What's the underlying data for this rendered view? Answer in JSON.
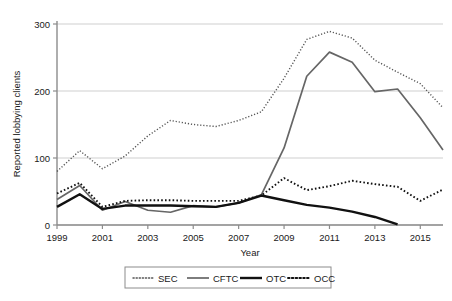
{
  "chart_data": {
    "type": "line",
    "title": "",
    "xlabel": "Year",
    "ylabel": "Reported lobbying clients",
    "xlim": [
      1999,
      2016
    ],
    "ylim": [
      0,
      300
    ],
    "grid": true,
    "legend_position": "bottom",
    "x_tick_labels": [
      "1999",
      "2001",
      "2003",
      "2005",
      "2007",
      "2009",
      "2011",
      "2013",
      "2015"
    ],
    "x_ticks": [
      1999,
      2001,
      2003,
      2005,
      2007,
      2009,
      2011,
      2013,
      2015
    ],
    "y_tick_labels": [
      "0",
      "100",
      "200",
      "300"
    ],
    "y_ticks": [
      0,
      100,
      200,
      300
    ],
    "x": [
      1999,
      2000,
      2001,
      2002,
      2003,
      2004,
      2005,
      2006,
      2007,
      2008,
      2009,
      2010,
      2011,
      2012,
      2013,
      2014,
      2015,
      2016
    ],
    "series": [
      {
        "name": "SEC",
        "style": "dotted",
        "color": "#555555",
        "width": 1.4,
        "values": [
          80,
          111,
          84,
          103,
          133,
          156,
          150,
          147,
          156,
          169,
          219,
          277,
          289,
          279,
          246,
          228,
          211,
          175
        ]
      },
      {
        "name": "CFTC",
        "style": "solid",
        "color": "#666666",
        "width": 1.7,
        "values": [
          38,
          59,
          22,
          35,
          22,
          19,
          29,
          27,
          33,
          45,
          115,
          222,
          258,
          243,
          199,
          203,
          160,
          112
        ]
      },
      {
        "name": "OTC",
        "style": "solid",
        "color": "#111111",
        "width": 2.4,
        "values": [
          27,
          46,
          24,
          29,
          29,
          29,
          28,
          27,
          33,
          44,
          37,
          30,
          26,
          20,
          12,
          1,
          null,
          null
        ]
      },
      {
        "name": "OCC",
        "style": "dotted",
        "color": "#111111",
        "width": 1.9,
        "values": [
          47,
          63,
          27,
          36,
          37,
          37,
          36,
          36,
          36,
          44,
          70,
          52,
          58,
          66,
          61,
          57,
          36,
          53
        ]
      }
    ]
  },
  "legend": {
    "entries": [
      {
        "label": "SEC"
      },
      {
        "label": "CFTC"
      },
      {
        "label": "OTC"
      },
      {
        "label": "OCC"
      }
    ]
  }
}
